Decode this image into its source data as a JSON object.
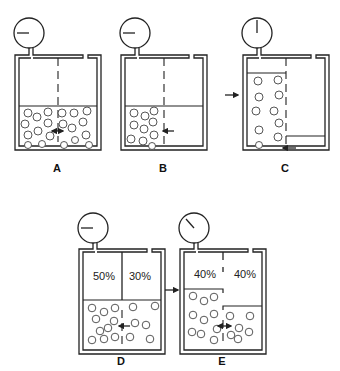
{
  "panels": [
    {
      "id": "A",
      "label": "A"
    },
    {
      "id": "B",
      "label": "B"
    },
    {
      "id": "C",
      "label": "C"
    },
    {
      "id": "D",
      "label": "D",
      "left_pct": "50%",
      "right_pct": "30%"
    },
    {
      "id": "E",
      "label": "E",
      "left_pct": "40%",
      "right_pct": "40%"
    }
  ],
  "colors": {
    "line": "#222222",
    "background": "#ffffff"
  }
}
